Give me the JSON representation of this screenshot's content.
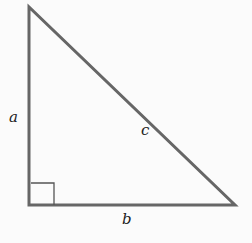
{
  "diagram": {
    "type": "right-triangle",
    "labels": {
      "leg_vertical": "a",
      "leg_horizontal": "b",
      "hypotenuse": "c"
    },
    "right_angle_marker": true,
    "colors": {
      "stroke": "#666666",
      "text": "#222222",
      "background": "#fbfbfb"
    }
  }
}
